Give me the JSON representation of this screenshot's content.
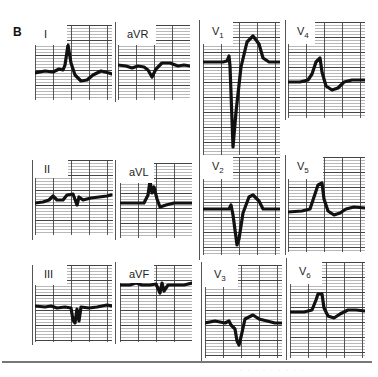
{
  "figure": {
    "panel_label": "B",
    "caption_fragment": "· · ·   · ·  · ·   · ·",
    "colors": {
      "grid_major": "#444444",
      "grid_minor": "#9a9a9a",
      "trace": "#111111",
      "background": "#ffffff"
    }
  },
  "leads": [
    {
      "id": "I",
      "label": "I",
      "sub": "",
      "x": 35,
      "y": 25,
      "w": 77,
      "h": 75,
      "labelW": 32,
      "labelH": 20,
      "trace": "M0,48 L10,46 L18,47 L24,44 L28,45 L30,40 L33,20 L36,38 L40,50 L46,56 L52,55 L58,50 L66,46 L74,48 L77,49"
    },
    {
      "id": "aVR",
      "label": "aVR",
      "sub": "",
      "x": 118,
      "y": 25,
      "w": 72,
      "h": 75,
      "labelW": 38,
      "labelH": 20,
      "trace": "M0,40 L8,41 L14,43 L20,41 L26,42 L30,45 L34,52 L38,44 L44,38 L52,38 L60,41 L66,40 L72,41"
    },
    {
      "id": "V1",
      "label": "V",
      "sub": "1",
      "x": 203,
      "y": 22,
      "w": 77,
      "h": 133,
      "labelW": 30,
      "labelH": 22,
      "trace": "M0,40 L20,40 L24,39 L26,34 L27,44 L30,125 L33,90 L38,45 L44,20 L50,14 L56,22 L60,36 L66,40 L77,40"
    },
    {
      "id": "V4",
      "label": "V",
      "sub": "4",
      "x": 288,
      "y": 22,
      "w": 77,
      "h": 96,
      "labelW": 27,
      "labelH": 22,
      "trace": "M0,60 L12,60 L20,58 L24,52 L28,40 L32,36 L34,50 L38,64 L44,68 L50,66 L56,60 L64,58 L77,58"
    },
    {
      "id": "II",
      "label": "II",
      "sub": "",
      "x": 35,
      "y": 160,
      "w": 78,
      "h": 75,
      "labelW": 33,
      "labelH": 18,
      "trace": "M0,43 L8,42 L14,40 L18,36 L22,40 L28,40 L32,35 L38,34 L42,45 L44,37 L48,40 L56,38 L64,37 L72,36 L76,35"
    },
    {
      "id": "aVL",
      "label": "aVL",
      "sub": "",
      "x": 120,
      "y": 163,
      "w": 72,
      "h": 75,
      "labelW": 34,
      "labelH": 20,
      "trace": "M0,40 L14,40 L24,40 L28,32 L30,18 L32,30 L34,24 L37,36 L40,44 L46,42 L54,40 L64,40 L72,40"
    },
    {
      "id": "V2",
      "label": "V",
      "sub": "2",
      "x": 203,
      "y": 157,
      "w": 77,
      "h": 98,
      "labelW": 30,
      "labelH": 22,
      "trace": "M0,52 L16,52 L26,52 L28,48 L30,58 L34,88 L36,82 L40,56 L46,40 L50,38 L56,44 L60,52 L68,52 L77,52"
    },
    {
      "id": "V5",
      "label": "V",
      "sub": "5",
      "x": 288,
      "y": 157,
      "w": 77,
      "h": 95,
      "labelW": 35,
      "labelH": 22,
      "trace": "M0,55 L14,54 L22,52 L26,40 L30,28 L34,26 L36,42 L40,54 L46,58 L52,56 L58,52 L66,50 L77,51"
    },
    {
      "id": "III",
      "label": "III",
      "sub": "",
      "x": 35,
      "y": 265,
      "w": 77,
      "h": 77,
      "labelW": 32,
      "labelH": 20,
      "trace": "M0,41 L10,42 L16,41 L22,43 L30,42 L36,43 L38,55 L40,58 L42,44 L44,56 L46,42 L54,43 L62,42 L72,40 L77,41"
    },
    {
      "id": "aVF",
      "label": "aVF",
      "sub": "",
      "x": 120,
      "y": 265,
      "w": 72,
      "h": 77,
      "labelW": 34,
      "labelH": 18,
      "trace": "M0,20 L10,20 L16,18 L22,20 L30,20 L36,19 L40,28 L42,18 L44,26 L48,20 L56,20 L64,20 L72,18"
    },
    {
      "id": "V3",
      "label": "V",
      "sub": "3",
      "x": 205,
      "y": 265,
      "w": 77,
      "h": 93,
      "labelW": 33,
      "labelH": 22,
      "trace": "M0,58 L10,56 L20,58 L24,56 L26,60 L30,64 L32,76 L34,80 L36,72 L40,54 L48,50 L54,54 L62,56 L70,58 L77,58"
    },
    {
      "id": "V6",
      "label": "V",
      "sub": "6",
      "x": 290,
      "y": 262,
      "w": 75,
      "h": 96,
      "labelW": 32,
      "labelH": 22,
      "trace": "M0,50 L14,50 L22,48 L26,38 L28,32 L32,32 L34,46 L38,54 L44,56 L50,52 L58,48 L66,48 L75,49"
    }
  ],
  "separators": [
    {
      "x": 115,
      "y": 22,
      "h": 80
    },
    {
      "x": 199,
      "y": 20,
      "h": 140
    },
    {
      "x": 285,
      "y": 20,
      "h": 100
    },
    {
      "x": 115,
      "y": 160,
      "h": 80
    },
    {
      "x": 199,
      "y": 155,
      "h": 105
    },
    {
      "x": 285,
      "y": 155,
      "h": 100
    },
    {
      "x": 32,
      "y": 160,
      "h": 80
    },
    {
      "x": 32,
      "y": 265,
      "h": 80
    },
    {
      "x": 115,
      "y": 262,
      "h": 82
    },
    {
      "x": 201,
      "y": 262,
      "h": 100
    },
    {
      "x": 286,
      "y": 258,
      "h": 102
    }
  ]
}
